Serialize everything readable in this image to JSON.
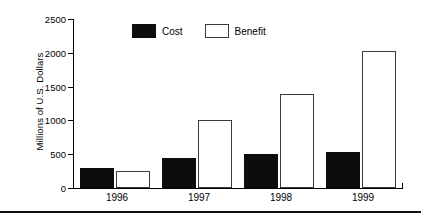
{
  "chart_data": {
    "type": "bar",
    "title": "",
    "subtitle": "",
    "xlabel": "",
    "ylabel": "Millions of U.S. Dollars",
    "categories": [
      "1996",
      "1997",
      "1998",
      "1999"
    ],
    "series": [
      {
        "name": "Cost",
        "color": "#0d0d0d",
        "fill": "solid",
        "values": [
          300,
          450,
          500,
          535
        ]
      },
      {
        "name": "Benefit",
        "color": "#ffffff",
        "fill": "outline",
        "values": [
          250,
          1000,
          1390,
          2030
        ]
      }
    ],
    "ylim": [
      0,
      2500
    ],
    "yticks": [
      0,
      500,
      1000,
      1500,
      2000,
      2500
    ],
    "ytick_labels": [
      "0",
      "500",
      "1000",
      "1500",
      "2000",
      "2500"
    ],
    "grid": false,
    "legend_position": "top-center",
    "legend": [
      "Cost",
      "Benefit"
    ]
  }
}
